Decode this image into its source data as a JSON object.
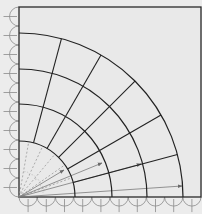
{
  "diagram": {
    "colors": {
      "background": "#e9e9e9",
      "lines": "#222222",
      "arrows": "#7a7a7a",
      "dashed": "#9a9a9a"
    },
    "frame": {
      "x": 19,
      "y": 7,
      "width": 182,
      "height": 190
    },
    "origin": {
      "x": 19,
      "y": 197
    },
    "arc_radii": [
      56,
      93,
      128,
      164
    ],
    "radial_angles_deg": [
      15,
      30,
      45,
      60,
      75
    ],
    "dashed_angles_deg": [
      20,
      35,
      50,
      65,
      80
    ],
    "arrows": [
      {
        "to_x": 64,
        "to_y": 170
      },
      {
        "to_x": 102,
        "to_y": 163
      },
      {
        "to_x": 141,
        "to_y": 164
      },
      {
        "to_x": 182,
        "to_y": 186
      }
    ],
    "left_scallops": 10,
    "bottom_scallops": 10
  }
}
